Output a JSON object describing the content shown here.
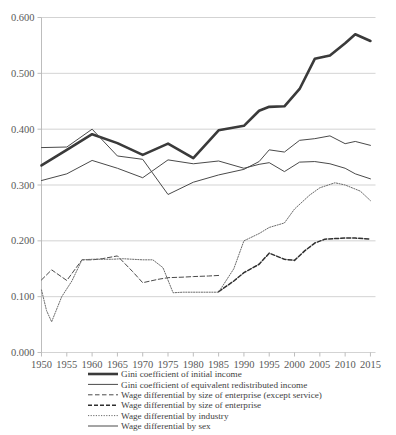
{
  "chart_data": {
    "type": "line",
    "title": "",
    "subtitle": "",
    "xlabel": "",
    "ylabel": "",
    "xlim": [
      1950,
      2016
    ],
    "ylim": [
      0.0,
      0.6
    ],
    "grid": true,
    "legend_position": "bottom",
    "y_ticks": [
      "0.000",
      "0.100",
      "0.200",
      "0.300",
      "0.400",
      "0.500",
      "0.600"
    ],
    "y_tick_values": [
      0.0,
      0.1,
      0.2,
      0.3,
      0.4,
      0.5,
      0.6
    ],
    "x_ticks": [
      "1950",
      "1955",
      "1960",
      "1965",
      "1970",
      "1975",
      "1980",
      "1985",
      "1990",
      "1995",
      "2000",
      "2005",
      "2010",
      "2015"
    ],
    "x_tick_values": [
      1950,
      1955,
      1960,
      1965,
      1970,
      1975,
      1980,
      1985,
      1990,
      1995,
      2000,
      2005,
      2010,
      2015
    ],
    "series": [
      {
        "name": "Gini coefficient of initial income",
        "style": "thick-solid",
        "color": "#3a3a3a",
        "x": [
          1950,
          1955,
          1960,
          1965,
          1970,
          1975,
          1980,
          1985,
          1990,
          1993,
          1995,
          1998,
          2001,
          2004,
          2007,
          2010,
          2012,
          2015
        ],
        "values": [
          0.335,
          0.363,
          0.391,
          0.375,
          0.354,
          0.374,
          0.348,
          0.398,
          0.406,
          0.433,
          0.44,
          0.441,
          0.472,
          0.526,
          0.532,
          0.554,
          0.57,
          0.558
        ]
      },
      {
        "name": "Gini coefficient of equivalent redistributed income",
        "style": "thin-solid",
        "color": "#4a4a4a",
        "x": [
          1950,
          1955,
          1960,
          1965,
          1970,
          1975,
          1980,
          1985,
          1990,
          1993,
          1995,
          1998,
          2001,
          2004,
          2007,
          2010,
          2012,
          2015
        ],
        "values": [
          0.308,
          0.32,
          0.344,
          0.33,
          0.313,
          0.345,
          0.338,
          0.343,
          0.33,
          0.337,
          0.34,
          0.324,
          0.341,
          0.342,
          0.338,
          0.33,
          0.32,
          0.311
        ]
      },
      {
        "name": "Wage differential by size of enterprise (except service)",
        "style": "dashed",
        "color": "#4a4a4a",
        "x": [
          1950,
          1952,
          1955,
          1958,
          1960,
          1962,
          1965,
          1968,
          1970,
          1973,
          1975,
          1978,
          1980,
          1983,
          1985
        ],
        "values": [
          0.13,
          0.148,
          0.129,
          0.166,
          0.166,
          0.168,
          0.173,
          0.145,
          0.125,
          0.131,
          0.134,
          0.135,
          0.136,
          0.137,
          0.138
        ]
      },
      {
        "name": "Wage differential by size of enterprise",
        "style": "dashed-bold",
        "color": "#2f2f2f",
        "x": [
          1985,
          1988,
          1990,
          1993,
          1995,
          1998,
          2000,
          2002,
          2004,
          2006,
          2008,
          2010,
          2012,
          2015
        ],
        "values": [
          0.109,
          0.128,
          0.143,
          0.158,
          0.178,
          0.167,
          0.165,
          0.182,
          0.196,
          0.203,
          0.204,
          0.205,
          0.205,
          0.203
        ]
      },
      {
        "name": "Wage differential by industry",
        "style": "dotted",
        "color": "#6a6a6a",
        "x": [
          1950,
          1951,
          1952,
          1954,
          1956,
          1958,
          1960,
          1962,
          1964,
          1966,
          1968,
          1970,
          1972,
          1974,
          1976,
          1978,
          1980,
          1983,
          1985,
          1988,
          1990,
          1993,
          1995,
          1998,
          2000,
          2003,
          2005,
          2008,
          2010,
          2013,
          2015
        ],
        "values": [
          0.112,
          0.075,
          0.055,
          0.1,
          0.128,
          0.166,
          0.167,
          0.167,
          0.167,
          0.168,
          0.167,
          0.166,
          0.166,
          0.152,
          0.107,
          0.108,
          0.108,
          0.108,
          0.108,
          0.15,
          0.2,
          0.213,
          0.224,
          0.232,
          0.257,
          0.282,
          0.295,
          0.304,
          0.3,
          0.289,
          0.272
        ]
      },
      {
        "name": "Wage differential by sex",
        "style": "thin-solid",
        "color": "#4a4a4a",
        "x": [
          1950,
          1955,
          1960,
          1965,
          1970,
          1975,
          1980,
          1985,
          1990,
          1993,
          1995,
          1998,
          2001,
          2004,
          2007,
          2010,
          2012,
          2015
        ],
        "values": [
          0.367,
          0.368,
          0.4,
          0.352,
          0.346,
          0.283,
          0.305,
          0.318,
          0.328,
          0.342,
          0.363,
          0.359,
          0.38,
          0.383,
          0.388,
          0.374,
          0.378,
          0.371
        ]
      }
    ]
  },
  "legend": {
    "items": [
      {
        "label": "Gini coefficient of initial income",
        "marker": "thick-solid-line"
      },
      {
        "label": "Gini coefficient of equivalent redistributed income",
        "marker": "thin-solid-line"
      },
      {
        "label": "Wage differential by size of enterprise (except service)",
        "marker": "long-dashed-line"
      },
      {
        "label": "Wage differential by size of enterprise",
        "marker": "short-dashed-line"
      },
      {
        "label": "Wage differential by industry",
        "marker": "dotted-line"
      },
      {
        "label": "Wage differential by sex",
        "marker": "thin-solid-line"
      }
    ]
  },
  "caption": {
    "text": ""
  }
}
